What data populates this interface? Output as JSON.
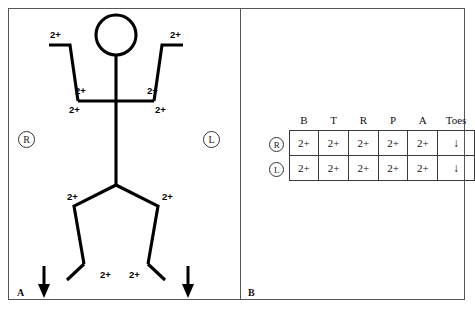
{
  "figure": {
    "panel_a_label": "A",
    "panel_b_label": "B",
    "reflex_grade": "2+",
    "plantar_arrow": "↓",
    "side_right": "R",
    "side_left": "L"
  },
  "stick_figure": {
    "side_markers": {
      "right": "R",
      "left": "L"
    },
    "reflex_labels": [
      {
        "name": "right-brachioradialis",
        "value": "2+"
      },
      {
        "name": "left-brachioradialis",
        "value": "2+"
      },
      {
        "name": "right-biceps",
        "value": "2+"
      },
      {
        "name": "left-biceps",
        "value": "2+"
      },
      {
        "name": "right-triceps",
        "value": "2+"
      },
      {
        "name": "left-triceps",
        "value": "2+"
      },
      {
        "name": "right-patellar",
        "value": "2+"
      },
      {
        "name": "left-patellar",
        "value": "2+"
      },
      {
        "name": "right-achilles",
        "value": "2+"
      },
      {
        "name": "left-achilles",
        "value": "2+"
      }
    ],
    "plantar_responses": [
      {
        "name": "right-plantar",
        "value": "↓"
      },
      {
        "name": "left-plantar",
        "value": "↓"
      }
    ]
  },
  "reflex_table": {
    "columns": [
      "B",
      "T",
      "R",
      "P",
      "A",
      "Toes"
    ],
    "rows": [
      {
        "side": "R",
        "values": [
          "2+",
          "2+",
          "2+",
          "2+",
          "2+",
          "↓"
        ]
      },
      {
        "side": "L",
        "values": [
          "2+",
          "2+",
          "2+",
          "2+",
          "2+",
          "↓"
        ]
      }
    ]
  },
  "colors": {
    "ink": "#000000",
    "frame": "#555555",
    "table_border": "#3a3a3a",
    "background": "#ffffff"
  }
}
